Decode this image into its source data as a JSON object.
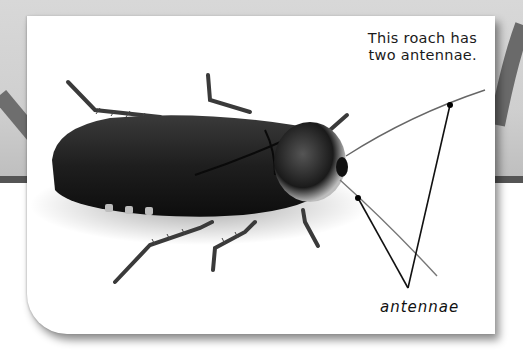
{
  "figure": {
    "subject": "roach",
    "callout": {
      "line1": "This roach has",
      "line2": "two antennae."
    },
    "label": "antennae",
    "colors": {
      "background_gray": "#d4d4d4",
      "stripe": "#555555",
      "card": "#ffffff",
      "roach_body": "#1c1c1c",
      "label_lines": "#111111"
    }
  }
}
